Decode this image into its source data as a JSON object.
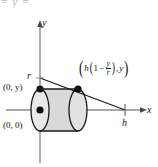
{
  "figure": {
    "name": "cone-cross-section-cylindrical-shell-diagram",
    "clipped_header_text": "= y =",
    "axes": {
      "y_axis_label": "y",
      "x_axis_label": "x",
      "origin_label": "(0, 0)",
      "y_intercept_label": "(0, y)",
      "radius_label": "r",
      "height_label": "h"
    },
    "point_label": {
      "open_paren": "(",
      "h": "h",
      "inner_open_paren": "(",
      "one": "1",
      "minus": "−",
      "numerator": "y",
      "denominator": "r",
      "inner_close_paren": ")",
      "comma": ",",
      "y": "y",
      "close_paren": ")",
      "plain": "(h(1 − y/r), y)"
    },
    "colors": {
      "axis": "#8a8a8a",
      "stroke": "#1a1a1a",
      "shell_fill": "#d9d9d9",
      "ellipse_fill": "#e6e6e6",
      "dot": "#111111",
      "background": "#ffffff",
      "clipped_text": "#b9b9b9"
    },
    "geometry": {
      "y_axis_x": 40,
      "x_axis_y": 110,
      "radius_point_y": 78,
      "h_point_x": 125,
      "shell_left_x": 40,
      "shell_right_x": 78,
      "shell_top_y": 89,
      "ellipse_rx": 9,
      "ellipse_ry": 21
    }
  }
}
